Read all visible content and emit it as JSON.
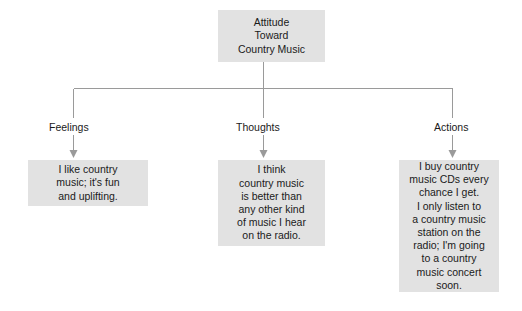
{
  "diagram": {
    "title_node": {
      "name": "attitude-root",
      "lines": [
        "Attitude",
        "Toward",
        "Country Music"
      ]
    },
    "branches": [
      {
        "key": "feelings",
        "label": "Feelings",
        "detail_lines": [
          "I like country",
          "music; it's fun",
          "and uplifting."
        ]
      },
      {
        "key": "thoughts",
        "label": "Thoughts",
        "detail_lines": [
          "I think",
          "country music",
          "is better than",
          "any other kind",
          "of music I hear",
          "on the radio."
        ]
      },
      {
        "key": "actions",
        "label": "Actions",
        "detail_lines": [
          "I buy country",
          "music CDs every",
          "chance I get.",
          "I only listen to",
          "a country music",
          "station on the",
          "radio; I'm going",
          "to a country",
          "music concert",
          "soon."
        ]
      }
    ],
    "colors": {
      "node_fill": "#e2e2e2",
      "text": "#1a1a1a",
      "connector": "#9a9a9a",
      "background": "#ffffff"
    }
  }
}
